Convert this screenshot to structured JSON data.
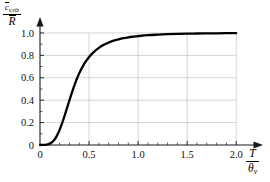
{
  "chart_data": {
    "type": "line",
    "title": "",
    "subtitle": "",
    "xlabel": "T/θv",
    "ylabel": "c̄v,vib / R̄",
    "xlabel_numerator": "T",
    "xlabel_denominator_base": "θ",
    "xlabel_denominator_sub": "v",
    "ylabel_numerator_base": "c",
    "ylabel_numerator_sub": "v,vib",
    "ylabel_denominator": "R",
    "xlim": [
      0,
      2.12
    ],
    "ylim": [
      0,
      1.08
    ],
    "grid": true,
    "grid_color": "#b9b9b9",
    "legend": "none",
    "curve_color": "#000000",
    "x_ticks": [
      0,
      0.5,
      1.0,
      1.5,
      2.0
    ],
    "x_tick_labels": [
      "0",
      "0.5",
      "1.0",
      "1.5",
      "2.0"
    ],
    "x_minor_ticks": [
      0.1,
      0.2,
      0.3,
      0.4,
      0.6,
      0.7,
      0.8,
      0.9,
      1.1,
      1.2,
      1.3,
      1.4,
      1.6,
      1.7,
      1.8,
      1.9
    ],
    "y_ticks": [
      0,
      0.2,
      0.4,
      0.6,
      0.8,
      1.0
    ],
    "y_tick_labels": [
      "0",
      "0.2",
      "0.4",
      "0.6",
      "0.8",
      "1.0"
    ],
    "y_minor_ticks": [
      0.1,
      0.3,
      0.5,
      0.7,
      0.9
    ],
    "series": [
      {
        "name": "vibrational specific heat",
        "x": [
          0.0,
          0.05,
          0.08,
          0.1,
          0.12,
          0.14,
          0.16,
          0.18,
          0.2,
          0.22,
          0.24,
          0.26,
          0.28,
          0.3,
          0.32,
          0.34,
          0.36,
          0.38,
          0.4,
          0.45,
          0.5,
          0.55,
          0.6,
          0.65,
          0.7,
          0.75,
          0.8,
          0.85,
          0.9,
          0.95,
          1.0,
          1.1,
          1.2,
          1.3,
          1.4,
          1.5,
          1.6,
          1.7,
          1.8,
          1.9,
          2.0
        ],
        "y": [
          0.0,
          0.002,
          0.006,
          0.012,
          0.023,
          0.04,
          0.064,
          0.096,
          0.135,
          0.181,
          0.232,
          0.287,
          0.343,
          0.399,
          0.454,
          0.506,
          0.555,
          0.6,
          0.641,
          0.724,
          0.786,
          0.832,
          0.867,
          0.894,
          0.915,
          0.931,
          0.943,
          0.953,
          0.961,
          0.967,
          0.972,
          0.98,
          0.985,
          0.989,
          0.992,
          0.994,
          0.995,
          0.996,
          0.997,
          0.998,
          0.999
        ]
      }
    ]
  }
}
